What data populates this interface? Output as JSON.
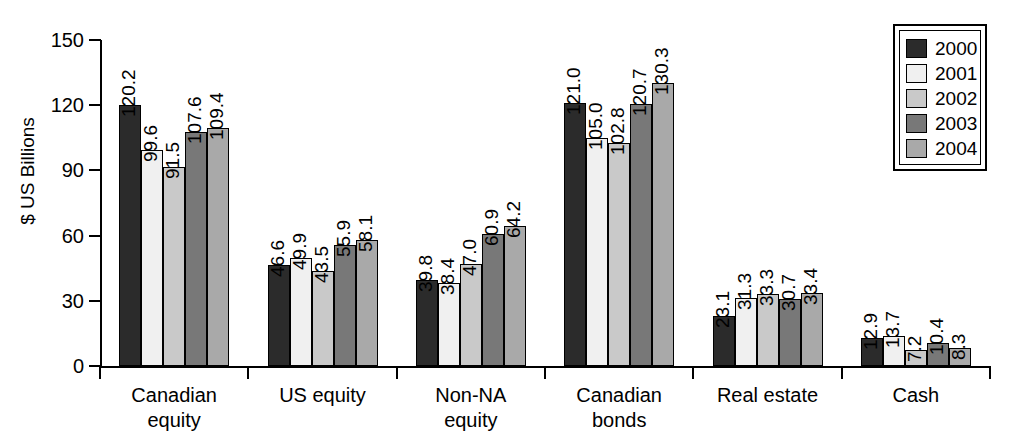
{
  "chart_data": {
    "type": "bar",
    "title": "",
    "xlabel": "",
    "ylabel": "$ US Billions",
    "ylim": [
      0,
      150
    ],
    "yticks": [
      0,
      30,
      60,
      90,
      120,
      150
    ],
    "ytick_labels": [
      "0",
      "30",
      "60",
      "90",
      "120",
      "150"
    ],
    "grid": false,
    "legend_position": "top-right",
    "categories": [
      "Canadian\nequity",
      "US equity",
      "Non-NA\nequity",
      "Canadian\nbonds",
      "Real estate",
      "Cash"
    ],
    "series": [
      {
        "name": "2000",
        "color": "#2b2b2b",
        "values": [
          120.2,
          46.6,
          39.8,
          121.0,
          23.1,
          12.9
        ],
        "labels": [
          "120.2",
          "46.6",
          "39.8",
          "121.0",
          "23.1",
          "12.9"
        ]
      },
      {
        "name": "2001",
        "color": "#f0f0f0",
        "values": [
          99.6,
          49.9,
          38.4,
          105.0,
          31.3,
          13.7
        ],
        "labels": [
          "99.6",
          "49.9",
          "38.4",
          "105.0",
          "31.3",
          "13.7"
        ]
      },
      {
        "name": "2002",
        "color": "#c9c9c9",
        "values": [
          91.5,
          43.5,
          47.0,
          102.8,
          33.3,
          7.2
        ],
        "labels": [
          "91.5",
          "43.5",
          "47.0",
          "102.8",
          "33.3",
          "7.2"
        ]
      },
      {
        "name": "2003",
        "color": "#787878",
        "values": [
          107.6,
          55.9,
          60.9,
          120.7,
          30.7,
          10.4
        ],
        "labels": [
          "107.6",
          "55.9",
          "60.9",
          "120.7",
          "30.7",
          "10.4"
        ]
      },
      {
        "name": "2004",
        "color": "#a9a9a9",
        "values": [
          109.4,
          58.1,
          64.2,
          130.3,
          33.4,
          8.3
        ],
        "labels": [
          "109.4",
          "58.1",
          "64.2",
          "130.3",
          "33.4",
          "8.3"
        ]
      }
    ]
  },
  "legend": {
    "entries": [
      {
        "label": "2000",
        "color": "#2b2b2b"
      },
      {
        "label": "2001",
        "color": "#f0f0f0"
      },
      {
        "label": "2002",
        "color": "#c9c9c9"
      },
      {
        "label": "2003",
        "color": "#787878"
      },
      {
        "label": "2004",
        "color": "#a9a9a9"
      }
    ]
  }
}
